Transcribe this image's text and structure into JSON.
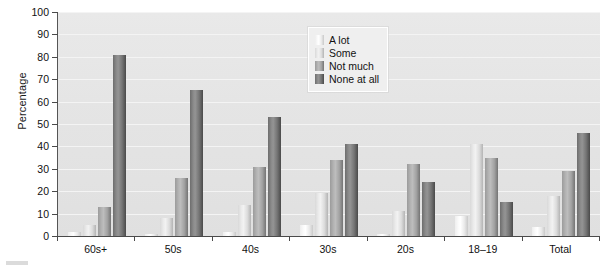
{
  "chart_data": {
    "type": "bar",
    "title": "",
    "xlabel": "",
    "ylabel": "Percentage",
    "ylim": [
      0,
      100
    ],
    "ytick_interval": 10,
    "yticks": [
      0,
      10,
      20,
      30,
      40,
      50,
      60,
      70,
      80,
      90,
      100
    ],
    "grid": true,
    "legend_position": "top-center-right",
    "categories": [
      "60s+",
      "50s",
      "40s",
      "30s",
      "20s",
      "18–19",
      "Total"
    ],
    "series": [
      {
        "name": "A lot",
        "color": "#f2f2f2",
        "values": [
          2,
          1,
          2,
          5,
          1,
          9,
          4
        ]
      },
      {
        "name": "Some",
        "color": "#dcdcdc",
        "values": [
          5,
          8,
          14,
          19,
          11,
          41,
          18
        ]
      },
      {
        "name": "Not much",
        "color": "#b0b0b0",
        "values": [
          13,
          26,
          31,
          34,
          32,
          35,
          29
        ]
      },
      {
        "name": "None at all",
        "color": "#7a7a7a",
        "values": [
          81,
          65,
          53,
          41,
          24,
          15,
          46
        ]
      }
    ]
  },
  "axis": {
    "y_title": "Percentage",
    "y_ticks": [
      "0",
      "10",
      "20",
      "30",
      "40",
      "50",
      "60",
      "70",
      "80",
      "90",
      "100"
    ],
    "x_ticks": [
      "60s+",
      "50s",
      "40s",
      "30s",
      "20s",
      "18–19",
      "Total"
    ]
  },
  "legend": {
    "items": [
      {
        "label": "A lot"
      },
      {
        "label": "Some"
      },
      {
        "label": "Not much"
      },
      {
        "label": "None at all"
      }
    ]
  }
}
